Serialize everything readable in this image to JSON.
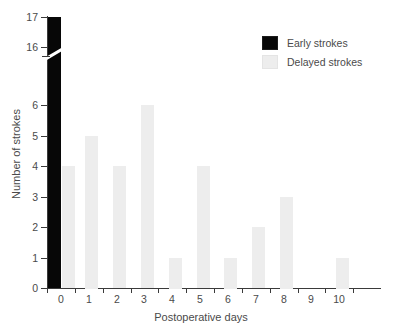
{
  "chart_data": {
    "type": "bar",
    "title": "",
    "subtitle": "",
    "xlabel": "Postoperative days",
    "ylabel": "Number of strokes",
    "categories": [
      "0",
      "1",
      "2",
      "3",
      "4",
      "5",
      "6",
      "7",
      "8",
      "9",
      "10"
    ],
    "x_tick_labels": [
      "0",
      "1",
      "2",
      "3",
      "4",
      "5",
      "6",
      "7",
      "8",
      "9",
      "10"
    ],
    "y_tick_labels": [
      "0",
      "1",
      "2",
      "3",
      "4",
      "5",
      "6",
      "16",
      "17"
    ],
    "y_tick_values": [
      0,
      1,
      2,
      3,
      4,
      5,
      6,
      16,
      17
    ],
    "ylim": [
      0,
      17
    ],
    "xlim": [
      0,
      11
    ],
    "axis_break": {
      "present": true,
      "between": [
        6,
        16
      ],
      "style": "diagonal-slash"
    },
    "grid": false,
    "legend_position": "top-right",
    "series": [
      {
        "name": "Early strokes",
        "color": "#070707",
        "values": [
          17,
          0,
          0,
          0,
          0,
          0,
          0,
          0,
          0,
          0,
          0
        ]
      },
      {
        "name": "Delayed strokes",
        "color": "#ededed",
        "values": [
          4,
          5,
          4,
          6,
          1,
          4,
          1,
          2,
          3,
          0,
          1
        ]
      }
    ],
    "annotations": []
  },
  "legend": {
    "items": [
      {
        "label": "Early strokes",
        "swatch": "early"
      },
      {
        "label": "Delayed strokes",
        "swatch": "delayed"
      }
    ]
  },
  "colors": {
    "early": "#070707",
    "delayed": "#ededed",
    "axis": "#3a3a3a",
    "text": "#4a4a4a",
    "background": "#ffffff"
  }
}
